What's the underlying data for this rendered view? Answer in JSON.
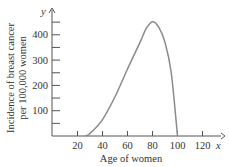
{
  "chart_data": {
    "type": "line",
    "title": "",
    "xlabel": "Age of women",
    "ylabel_line1": "Incidence of breast cancer",
    "ylabel_line2": "per 100,000 women",
    "x_axis_var": "x",
    "y_axis_var": "y",
    "xlim": [
      0,
      130
    ],
    "ylim": [
      0,
      480
    ],
    "x_ticks": [
      20,
      40,
      60,
      80,
      100,
      120
    ],
    "y_ticks": [
      100,
      200,
      300,
      400
    ],
    "y_minor_ticks": [
      50,
      150,
      250,
      350,
      450
    ],
    "grid": false,
    "legend": "none",
    "series": [
      {
        "name": "Incidence",
        "color": "#8a8a8a",
        "x": [
          26,
          30,
          40,
          50,
          60,
          70,
          75,
          80,
          85,
          90,
          95,
          100
        ],
        "values": [
          0,
          10,
          65,
          155,
          265,
          370,
          425,
          452,
          430,
          370,
          250,
          0
        ]
      }
    ]
  },
  "labels": {
    "x_ticks": [
      "20",
      "40",
      "60",
      "80",
      "100",
      "120"
    ],
    "y_ticks": [
      "100",
      "200",
      "300",
      "400"
    ]
  }
}
